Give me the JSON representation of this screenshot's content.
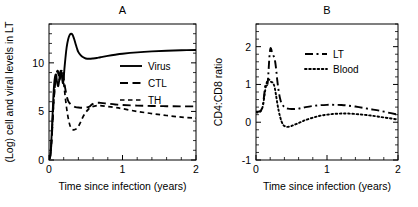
{
  "figure": {
    "background": "#ffffff",
    "foreground": "#000000"
  },
  "chart_data": [
    {
      "type": "line",
      "panel": "A",
      "title": "A",
      "xlabel": "Time since infection (years)",
      "ylabel": "(Log) cell and viral levels in LT",
      "xlim": [
        0,
        2
      ],
      "ylim": [
        0,
        14
      ],
      "xticks": [
        0,
        1,
        2
      ],
      "xticklabels": [
        "0",
        "1",
        "2"
      ],
      "yticks": [
        0,
        5,
        10
      ],
      "yticklabels": [
        "0",
        "5",
        "10"
      ],
      "grid": false,
      "legend_position": "center-right",
      "series": [
        {
          "name": "Virus",
          "style": "solid",
          "x": [
            0.0,
            0.02,
            0.04,
            0.06,
            0.075,
            0.09,
            0.1,
            0.11,
            0.125,
            0.14,
            0.15,
            0.16,
            0.17,
            0.18,
            0.19,
            0.2,
            0.21,
            0.225,
            0.24,
            0.26,
            0.28,
            0.3,
            0.32,
            0.34,
            0.36,
            0.38,
            0.4,
            0.43,
            0.46,
            0.5,
            0.55,
            0.6,
            0.65,
            0.7,
            0.8,
            0.9,
            1.0,
            1.2,
            1.4,
            1.6,
            1.8,
            2.0
          ],
          "y": [
            0.05,
            0.6,
            3.2,
            6.6,
            8.2,
            8.8,
            8.6,
            8.0,
            7.6,
            8.3,
            9.0,
            9.2,
            9.0,
            8.3,
            7.9,
            8.4,
            9.4,
            10.6,
            11.6,
            12.4,
            12.85,
            13.0,
            12.9,
            12.5,
            12.0,
            11.5,
            11.1,
            10.8,
            10.6,
            10.45,
            10.42,
            10.45,
            10.5,
            10.58,
            10.72,
            10.84,
            10.94,
            11.08,
            11.18,
            11.25,
            11.3,
            11.33
          ]
        },
        {
          "name": "CTL",
          "style": "long-dash",
          "x": [
            0.0,
            0.02,
            0.04,
            0.06,
            0.08,
            0.1,
            0.115,
            0.13,
            0.145,
            0.16,
            0.17,
            0.18,
            0.19,
            0.2,
            0.21,
            0.22,
            0.24,
            0.26,
            0.28,
            0.3,
            0.33,
            0.36,
            0.4,
            0.45,
            0.5,
            0.55,
            0.58,
            0.62,
            0.66,
            0.7,
            0.8,
            0.9,
            1.0,
            1.2,
            1.4,
            1.6,
            1.8,
            2.0
          ],
          "y": [
            0.05,
            0.5,
            2.6,
            5.6,
            7.6,
            8.7,
            9.2,
            8.9,
            8.3,
            8.9,
            9.3,
            9.3,
            9.0,
            8.4,
            7.9,
            7.4,
            6.6,
            6.1,
            5.85,
            5.7,
            5.55,
            5.45,
            5.4,
            5.38,
            5.4,
            5.5,
            5.7,
            5.85,
            5.9,
            5.88,
            5.8,
            5.72,
            5.66,
            5.6,
            5.56,
            5.54,
            5.52,
            5.52
          ]
        },
        {
          "name": "TH",
          "style": "short-dash",
          "x": [
            0.0,
            0.02,
            0.04,
            0.06,
            0.08,
            0.1,
            0.115,
            0.13,
            0.145,
            0.16,
            0.17,
            0.185,
            0.2,
            0.215,
            0.23,
            0.25,
            0.27,
            0.29,
            0.31,
            0.34,
            0.37,
            0.4,
            0.43,
            0.46,
            0.5,
            0.54,
            0.58,
            0.62,
            0.66,
            0.7,
            0.8,
            0.9,
            1.0,
            1.2,
            1.4,
            1.6,
            1.8,
            2.0
          ],
          "y": [
            0.05,
            0.5,
            2.6,
            5.5,
            7.5,
            8.6,
            9.1,
            8.8,
            8.2,
            8.8,
            9.2,
            8.8,
            7.9,
            6.9,
            5.9,
            4.8,
            4.0,
            3.45,
            3.2,
            3.1,
            3.2,
            3.45,
            3.9,
            4.4,
            4.9,
            5.25,
            5.45,
            5.55,
            5.6,
            5.6,
            5.5,
            5.4,
            5.28,
            5.0,
            4.78,
            4.58,
            4.42,
            4.3
          ]
        }
      ]
    },
    {
      "type": "line",
      "panel": "B",
      "title": "B",
      "xlabel": "Time since infection (years)",
      "ylabel": "CD4:CD8 ratio",
      "xlim": [
        0,
        2
      ],
      "ylim": [
        -1,
        2.6
      ],
      "xticks": [
        0,
        1,
        2
      ],
      "xticklabels": [
        "0",
        "1",
        "2"
      ],
      "yticks": [
        -1,
        0,
        1,
        2
      ],
      "yticklabels": [
        "-1",
        "0",
        "1",
        "2"
      ],
      "grid": false,
      "legend_position": "top-right",
      "series": [
        {
          "name": "LT",
          "style": "dash-dot",
          "x": [
            0.0,
            0.03,
            0.06,
            0.08,
            0.1,
            0.115,
            0.125,
            0.135,
            0.145,
            0.155,
            0.165,
            0.175,
            0.185,
            0.195,
            0.205,
            0.215,
            0.225,
            0.24,
            0.255,
            0.27,
            0.285,
            0.3,
            0.32,
            0.34,
            0.36,
            0.39,
            0.42,
            0.45,
            0.5,
            0.55,
            0.6,
            0.65,
            0.7,
            0.8,
            0.9,
            1.0,
            1.1,
            1.2,
            1.3,
            1.45,
            1.6,
            1.75,
            1.9,
            2.0
          ],
          "y": [
            0.28,
            0.28,
            0.3,
            0.35,
            0.5,
            0.72,
            0.9,
            1.0,
            1.02,
            0.98,
            1.05,
            1.3,
            1.62,
            1.86,
            1.96,
            1.93,
            1.85,
            1.78,
            1.72,
            1.6,
            1.38,
            1.1,
            0.82,
            0.62,
            0.5,
            0.42,
            0.38,
            0.36,
            0.35,
            0.35,
            0.36,
            0.38,
            0.4,
            0.43,
            0.45,
            0.46,
            0.46,
            0.455,
            0.44,
            0.4,
            0.35,
            0.3,
            0.24,
            0.2
          ]
        },
        {
          "name": "Blood",
          "style": "dotted",
          "x": [
            0.0,
            0.03,
            0.06,
            0.08,
            0.1,
            0.115,
            0.13,
            0.145,
            0.16,
            0.175,
            0.19,
            0.205,
            0.22,
            0.235,
            0.25,
            0.265,
            0.28,
            0.3,
            0.32,
            0.34,
            0.36,
            0.38,
            0.4,
            0.43,
            0.46,
            0.5,
            0.55,
            0.6,
            0.65,
            0.7,
            0.8,
            0.9,
            1.0,
            1.1,
            1.2,
            1.3,
            1.45,
            1.6,
            1.75,
            1.9,
            2.0
          ],
          "y": [
            0.26,
            0.26,
            0.28,
            0.33,
            0.46,
            0.65,
            0.85,
            1.0,
            1.1,
            1.14,
            1.12,
            1.08,
            1.06,
            1.05,
            1.0,
            0.9,
            0.74,
            0.5,
            0.3,
            0.14,
            0.02,
            -0.06,
            -0.1,
            -0.12,
            -0.12,
            -0.1,
            -0.06,
            -0.02,
            0.02,
            0.06,
            0.12,
            0.17,
            0.2,
            0.22,
            0.23,
            0.23,
            0.21,
            0.18,
            0.14,
            0.1,
            0.07
          ]
        }
      ]
    }
  ]
}
